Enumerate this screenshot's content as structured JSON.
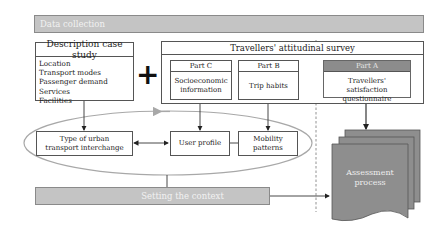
{
  "data_collection": {
    "label": "Data collection"
  },
  "case_study": {
    "title": "Description case study",
    "items": [
      "Location",
      "Transport modes",
      "Passenger demand",
      "Services",
      "Facilities"
    ]
  },
  "plus_symbol": "+",
  "survey": {
    "title": "Travellers' attitudinal survey",
    "part_c": {
      "header": "Part C",
      "body": "Socioeconomic information"
    },
    "part_b": {
      "header": "Part B",
      "body": "Trip habits"
    },
    "part_a": {
      "header": "Part A",
      "body": "Travellers' satisfaction questionnaire"
    }
  },
  "context_group": {
    "type_box": "Type of urban transport interchange",
    "user_profile": "User profile",
    "mobility": "Mobility patterns"
  },
  "setting_context": {
    "label": "Setting the context"
  },
  "assessment": {
    "label": "Assessment process"
  },
  "colors": {
    "bar_fill": "#c4c4c4",
    "part_a_header": "#8c8c8c",
    "document_fill": "#8e8e8e",
    "ellipse_stroke": "#a8a8a8",
    "line": "#333333"
  }
}
